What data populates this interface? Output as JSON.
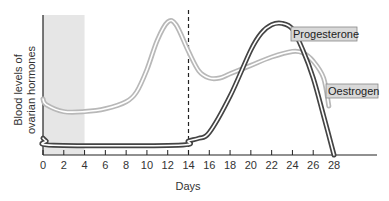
{
  "chart_data": {
    "type": "line",
    "title": "",
    "xlabel": "Days",
    "ylabel": "Blood levels of ovarian hormones",
    "ylabel_lines": [
      "Blood levels of",
      "ovarian hormones"
    ],
    "xlim": [
      0,
      28
    ],
    "ylim": [
      0,
      100
    ],
    "x_ticks": [
      0,
      2,
      4,
      6,
      8,
      10,
      12,
      14,
      16,
      18,
      20,
      22,
      24,
      26,
      28
    ],
    "x_tick_labels": [
      "0",
      "2",
      "4",
      "6",
      "8",
      "10",
      "12",
      "14",
      "16",
      "18",
      "20",
      "22",
      "24",
      "26",
      "28"
    ],
    "y_units": "relative (no numeric scale shown)",
    "grid": false,
    "shaded_region": {
      "x_range": [
        0,
        4
      ],
      "label": ""
    },
    "reference_line": {
      "x": 14,
      "style": "dashed"
    },
    "series": [
      {
        "name": "Oestrogen",
        "color": "#b8b8b8",
        "points": [
          [
            0,
            40
          ],
          [
            0.3,
            36
          ],
          [
            2,
            31
          ],
          [
            4,
            31
          ],
          [
            6,
            33
          ],
          [
            8,
            38
          ],
          [
            9,
            45
          ],
          [
            10,
            61
          ],
          [
            11,
            82
          ],
          [
            12,
            95
          ],
          [
            12.8,
            93
          ],
          [
            14,
            74
          ],
          [
            15,
            60
          ],
          [
            16,
            55
          ],
          [
            17,
            55
          ],
          [
            18,
            58
          ],
          [
            20,
            64
          ],
          [
            22,
            70
          ],
          [
            24,
            74
          ],
          [
            25,
            73
          ],
          [
            26,
            67
          ],
          [
            27,
            55
          ],
          [
            27.5,
            35
          ]
        ]
      },
      {
        "name": "Progesterone",
        "color": "#444444",
        "points": [
          [
            0,
            12
          ],
          [
            0.3,
            10
          ],
          [
            1,
            7
          ],
          [
            13,
            7
          ],
          [
            14,
            10
          ],
          [
            15,
            12
          ],
          [
            16,
            16
          ],
          [
            18,
            42
          ],
          [
            20,
            75
          ],
          [
            21,
            87
          ],
          [
            22,
            93
          ],
          [
            23,
            94
          ],
          [
            24,
            90
          ],
          [
            25,
            75
          ],
          [
            26,
            55
          ],
          [
            27,
            28
          ],
          [
            28,
            0
          ]
        ]
      }
    ],
    "legend": [
      {
        "label": "Progesterone",
        "placement": "top-right"
      },
      {
        "label": "Oestrogen",
        "placement": "right"
      }
    ]
  }
}
